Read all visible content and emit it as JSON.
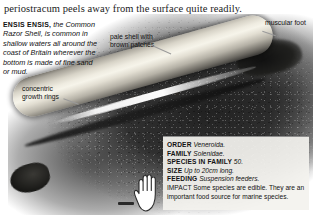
{
  "page": {
    "running_text": "periostracum peels away from the surface quite readily."
  },
  "caption": {
    "species_smallcaps": "ENSIS ENSIS,",
    "body": " the Common Razor Shell, is common in shallow waters all around the coast of Britain wherever the bottom is made of fine sand or mud."
  },
  "annotations": [
    {
      "id": "pale-shell",
      "text": "pale shell with brown patches"
    },
    {
      "id": "muscular-foot",
      "text": "muscular foot"
    },
    {
      "id": "concentric-growth-rings",
      "text": "concentric growth rings"
    }
  ],
  "factbox": {
    "rows": [
      {
        "key": "ORDER",
        "value": "Veneroida."
      },
      {
        "key": "FAMILY",
        "value": "Solenidae."
      },
      {
        "key": "SPECIES IN FAMILY",
        "value": "50."
      },
      {
        "key": "SIZE",
        "value": "Up to 20cm long."
      },
      {
        "key": "FEEDING",
        "value": "Suspension feeders."
      }
    ],
    "impact_key": "IMPACT",
    "impact_value": "Some species are edible. They are an important food source for marine species."
  },
  "icons": {
    "hand_scale": "hand-scale-icon",
    "scale_bar": "scale-bar"
  },
  "colors": {
    "page_background": "#ffffff",
    "text": "#121212",
    "factbox_background": "#f3f2ee",
    "factbox_rule": "#8d8d8d",
    "shell_pale": "#f6f4ea",
    "sand_dark": "#1a1a1a"
  }
}
